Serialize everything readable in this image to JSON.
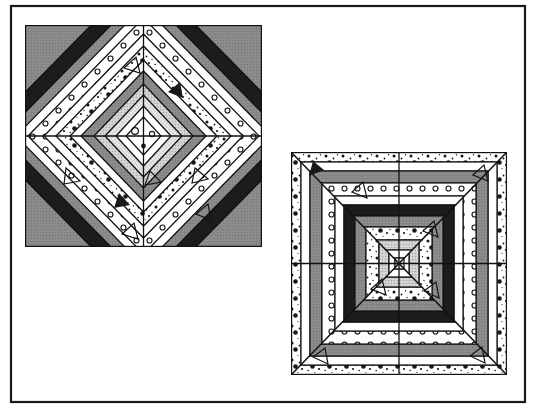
{
  "figure": {
    "background_color": "#ffffff",
    "frame": {
      "name": "outer-frame",
      "x": 11,
      "y": 6,
      "width": 514,
      "height": 396,
      "stroke_color": "#1a1a1a",
      "stroke_width": 2.2,
      "fill": "none"
    }
  },
  "palette": {
    "black": "#1c1c1c",
    "dark_gray": "#3a3a3a",
    "mid_gray": "#8d8d8d",
    "light_gray": "#cfcfcf",
    "pale_gray": "#e4e4e4",
    "white": "#ffffff",
    "outline": "#111111"
  },
  "fabrics": [
    {
      "id": "f-black",
      "label": "solid black",
      "fill": "#1c1c1c",
      "texture": "solid"
    },
    {
      "id": "f-midgray",
      "label": "solid medium gray",
      "fill": "#8d8d8d",
      "texture": "solid"
    },
    {
      "id": "f-lightgray",
      "label": "solid light gray",
      "fill": "#cfcfcf",
      "texture": "solid"
    },
    {
      "id": "f-palegray",
      "label": "pale gray stipple",
      "fill": "#e4e4e4",
      "texture": "fine-stipple"
    },
    {
      "id": "f-white",
      "label": "plain white",
      "fill": "#ffffff",
      "texture": "none"
    },
    {
      "id": "f-circles",
      "label": "white with open circles",
      "fill": "#ffffff",
      "texture": "open-circles"
    },
    {
      "id": "f-speckle",
      "label": "white with dark speckles",
      "fill": "#ffffff",
      "texture": "speckled-dots"
    },
    {
      "id": "f-triangles",
      "label": "white with triangles",
      "fill": "#ffffff",
      "texture": "small-triangles"
    }
  ],
  "blocks": [
    {
      "name": "left-quilt-block",
      "pattern_type": "concentric-diamond-medallion",
      "x": 25,
      "y": 25,
      "width": 237,
      "height": 222,
      "center_x": 143.5,
      "center_y": 136,
      "symmetry": "four-fold mirrored quadrants",
      "band_count": 13,
      "bands_outer_to_inner": [
        "f-midgray",
        "f-black",
        "f-midgray",
        "f-white",
        "f-circles",
        "f-white",
        "f-speckle",
        "f-white",
        "f-midgray",
        "f-lightgray",
        "f-palegray",
        "f-white",
        "f-white"
      ],
      "center_motif": "small open diamond with two circles and a dot"
    },
    {
      "name": "right-quilt-block",
      "pattern_type": "eight-sector-chevron-sunburst",
      "x": 291,
      "y": 152,
      "width": 216,
      "height": 223,
      "center_x": 399,
      "center_y": 263.5,
      "symmetry": "mirrored across both axes, eight radiating sectors",
      "band_count": 11,
      "bands_outer_to_inner": [
        "f-speckle",
        "f-white",
        "f-midgray",
        "f-circles",
        "f-white",
        "f-black",
        "f-midgray",
        "f-speckle",
        "f-lightgray",
        "f-white",
        "f-palegray"
      ],
      "center_motif": "eight wedges converging at a single point"
    }
  ]
}
